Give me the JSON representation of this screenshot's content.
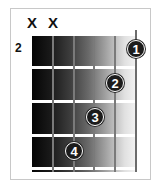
{
  "diagram": {
    "type": "guitar-chord-chart",
    "start_fret_label": "2",
    "muted_strings": [
      {
        "string": 6,
        "symbol": "X"
      },
      {
        "string": 5,
        "symbol": "X"
      }
    ],
    "fingers": [
      {
        "finger": "1",
        "string": 1,
        "fret": 1
      },
      {
        "finger": "2",
        "string": 2,
        "fret": 2
      },
      {
        "finger": "3",
        "string": 3,
        "fret": 3
      },
      {
        "finger": "4",
        "string": 4,
        "fret": 4
      }
    ],
    "frets_shown": 4,
    "strings": 6,
    "colors": {
      "board_dark": "#050505",
      "board_light": "#f4f4f4",
      "fret_line": "#ffffff",
      "string": "#7a7a7a",
      "dot": "#1c1c1c"
    }
  }
}
